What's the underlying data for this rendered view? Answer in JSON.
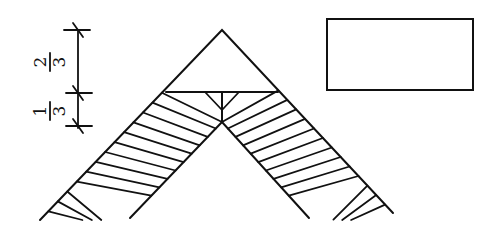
{
  "diagram": {
    "dimension_labels": {
      "upper": {
        "numerator": "2",
        "denominator": "3"
      },
      "lower": {
        "numerator": "1",
        "denominator": "3"
      }
    },
    "colors": {
      "stroke": "#111111",
      "background": "#ffffff"
    }
  }
}
